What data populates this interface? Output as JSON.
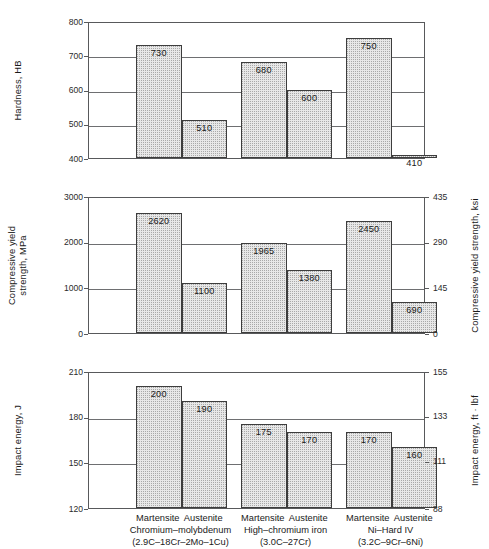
{
  "figure": {
    "title": "",
    "categories": [
      "Martensite",
      "Austenite",
      "Martensite",
      "Austenite",
      "Martensite",
      "Austenite"
    ],
    "groups": [
      {
        "name": "Chromium–molybdenum",
        "composition": "(2.9C–18Cr–2Mo–1Cu)"
      },
      {
        "name": "High–chromium iron",
        "composition": "(3.0C–27Cr)"
      },
      {
        "name": "Ni–Hard IV",
        "composition": "(3.2C–9Cr–6Ni)"
      }
    ],
    "colors": {
      "bar_fill": "#e8e8e8",
      "bar_stipple": "#a9a9a9",
      "bar_edge": "#3d3d3d",
      "axis": "#58595b",
      "grid": "#6e6f71",
      "text": "#1a1a1a"
    }
  },
  "chart_data": [
    {
      "type": "bar",
      "title": "",
      "ylabel": "Hardness, HB",
      "xlabel": "",
      "categories": [
        "Martensite",
        "Austenite",
        "Martensite",
        "Austenite",
        "Martensite",
        "Austenite"
      ],
      "values": [
        730,
        510,
        680,
        600,
        750,
        410
      ],
      "value_labels": [
        "730",
        "510",
        "680",
        "600",
        "750",
        "410"
      ],
      "ylim": [
        400,
        800
      ],
      "yticks": [
        400,
        500,
        600,
        700,
        800
      ],
      "ytick_labels": [
        "400",
        "500",
        "600",
        "700",
        "800"
      ],
      "grid": true,
      "secondary_axis": null
    },
    {
      "type": "bar",
      "title": "",
      "ylabel": "Compressive yield\nstrength, MPa",
      "ylabel_line1": "Compressive yield",
      "ylabel_line2": "strength, MPa",
      "xlabel": "",
      "categories": [
        "Martensite",
        "Austenite",
        "Martensite",
        "Austenite",
        "Martensite",
        "Austenite"
      ],
      "values": [
        2620,
        1100,
        1965,
        1380,
        2450,
        690
      ],
      "value_labels": [
        "2620",
        "1100",
        "1965",
        "1380",
        "2450",
        "690"
      ],
      "ylim": [
        0,
        3000
      ],
      "yticks": [
        0,
        1000,
        2000,
        3000
      ],
      "ytick_labels": [
        "0",
        "1000",
        "2000",
        "3000"
      ],
      "grid": true,
      "secondary_axis": {
        "label": "Compressive yield strength, ksi",
        "ylim": [
          0,
          435
        ],
        "yticks": [
          0,
          145,
          290,
          435
        ],
        "ytick_labels": [
          "0",
          "145",
          "290",
          "435"
        ]
      }
    },
    {
      "type": "bar",
      "title": "",
      "ylabel": "Impact energy, J",
      "xlabel": "",
      "categories": [
        "Martensite",
        "Austenite",
        "Martensite",
        "Austenite",
        "Martensite",
        "Austenite"
      ],
      "values": [
        200,
        190,
        175,
        170,
        170,
        160
      ],
      "value_labels": [
        "200",
        "190",
        "175",
        "170",
        "170",
        "160"
      ],
      "ylim": [
        120,
        210
      ],
      "yticks": [
        120,
        150,
        180,
        210
      ],
      "ytick_labels": [
        "120",
        "150",
        "180",
        "210"
      ],
      "grid": true,
      "secondary_axis": {
        "label": "Impact energy, ft · lbf",
        "ylim": [
          88,
          155
        ],
        "yticks": [
          88,
          111,
          133,
          155
        ],
        "ytick_labels": [
          "88",
          "111",
          "133",
          "155"
        ]
      }
    }
  ]
}
